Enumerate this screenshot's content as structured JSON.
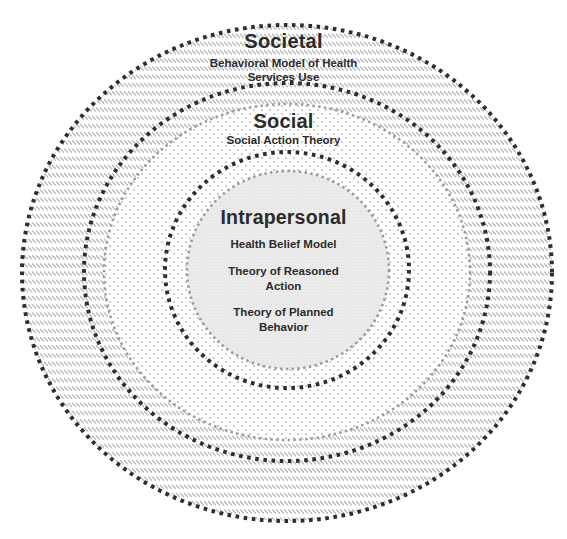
{
  "diagram": {
    "center": {
      "x": 287,
      "y": 273
    },
    "colors": {
      "ring_stroke": "#2e2e2e",
      "boundary_stroke": "#9a9a9a",
      "hatch": "#a8a8a8",
      "dots": "#9c9c9c",
      "core_fill": "#e9e9e9",
      "text": "#2b2b2b"
    },
    "levels": [
      {
        "id": "societal",
        "title": "Societal",
        "pattern": "diagonal-hatch",
        "ellipse": {
          "rx": 265,
          "ry": 248
        },
        "theories": [
          "Behavioral Model of Health",
          "Services Use"
        ],
        "theory_full": "Behavioral Model of Health Services Use"
      },
      {
        "id": "social",
        "title": "Social",
        "pattern": "dots",
        "ellipse": {
          "rx": 203,
          "ry": 189
        },
        "inner_boundary": {
          "rx": 183,
          "ry": 168
        },
        "theories": [
          "Social Action Theory"
        ]
      },
      {
        "id": "intrapersonal",
        "title": "Intrapersonal",
        "pattern": "solid-light-gray",
        "ellipse": {
          "rx": 122,
          "ry": 118
        },
        "core": {
          "rx": 101,
          "ry": 99
        },
        "theories": [
          {
            "lines": [
              "Health Belief Model"
            ],
            "full": "Health Belief Model"
          },
          {
            "lines": [
              "Theory of Reasoned",
              "Action"
            ],
            "full": "Theory of Reasoned Action"
          },
          {
            "lines": [
              "Theory of Planned",
              "Behavior"
            ],
            "full": "Theory of Planned Behavior"
          }
        ]
      }
    ]
  }
}
